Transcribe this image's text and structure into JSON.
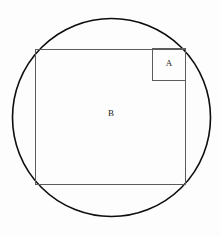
{
  "figure": {
    "background_color": "#fdfdfd",
    "canvas": {
      "width": 220,
      "height": 237
    },
    "shapes": {
      "circle": {
        "name": "circle",
        "label": "",
        "center_x": 111.5,
        "center_y": 117.5,
        "radius": 99,
        "stroke_color": "#0d0d0d",
        "stroke_width": 1.6,
        "fill": "none"
      },
      "square_b": {
        "name": "square-b",
        "label": "B",
        "label_x": 111,
        "label_y": 114,
        "x": 35,
        "y": 49,
        "width": 151,
        "height": 136,
        "stroke_color": "#5c5c5c",
        "stroke_width": 1,
        "fill": "none"
      },
      "square_a": {
        "name": "square-a",
        "label": "A",
        "label_x": 169,
        "label_y": 64,
        "x": 152,
        "y": 48,
        "width": 34,
        "height": 33,
        "stroke_color": "#5c5c5c",
        "stroke_width": 1,
        "fill": "none"
      }
    }
  }
}
